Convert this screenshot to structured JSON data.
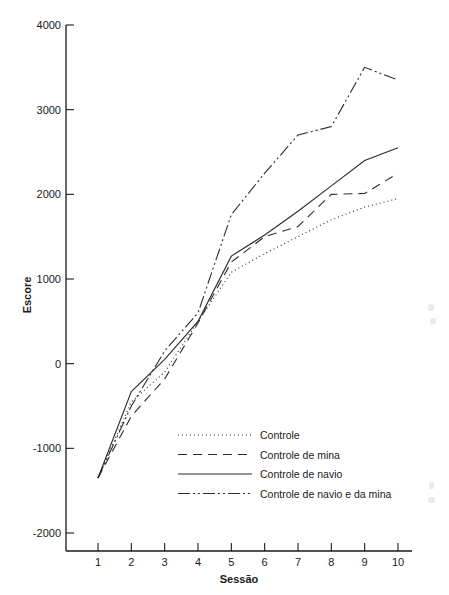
{
  "chart_data": {
    "type": "line",
    "title": "",
    "xlabel": "Sessão",
    "ylabel": "Escore",
    "x": [
      1,
      2,
      3,
      4,
      5,
      6,
      7,
      8,
      9,
      10
    ],
    "categories": [
      "1",
      "2",
      "3",
      "4",
      "5",
      "6",
      "7",
      "8",
      "9",
      "10"
    ],
    "xlim": [
      0.6,
      10.4
    ],
    "ylim": [
      -2200,
      4000
    ],
    "yticks": [
      -2000,
      -1000,
      0,
      1000,
      2000,
      3000,
      4000
    ],
    "ytick_labels": [
      "-2000",
      "-1000",
      "0",
      "1000",
      "2000",
      "3000",
      "4000"
    ],
    "xticks": [
      1,
      2,
      3,
      4,
      5,
      6,
      7,
      8,
      9,
      10
    ],
    "xtick_labels": [
      "1",
      "2",
      "3",
      "4",
      "5",
      "6",
      "7",
      "8",
      "9",
      "10"
    ],
    "grid": false,
    "legend_position": "center",
    "series": [
      {
        "name": "Controle",
        "style": "dotted",
        "dasharray": "1,3",
        "color": "#2b2b2b",
        "values": [
          -1350,
          -450,
          -100,
          500,
          1080,
          1300,
          1500,
          1700,
          1850,
          1950
        ]
      },
      {
        "name": "Controle de mina",
        "style": "dashed",
        "dasharray": "9,6",
        "color": "#2b2b2b",
        "values": [
          -1350,
          -620,
          -180,
          480,
          1200,
          1500,
          1620,
          2000,
          2010,
          2250
        ]
      },
      {
        "name": "Controle de navio",
        "style": "solid",
        "dasharray": "none",
        "color": "#2b2b2b",
        "values": [
          -1350,
          -330,
          50,
          500,
          1270,
          1520,
          1800,
          2100,
          2400,
          2550
        ]
      },
      {
        "name": "Controle de navio e da mina",
        "style": "dash-dot-dot",
        "dasharray": "12,3,2,3,2,3",
        "color": "#2b2b2b",
        "values": [
          -1350,
          -500,
          150,
          600,
          1760,
          2250,
          2700,
          2800,
          3500,
          3350
        ]
      }
    ]
  },
  "legend": {
    "items": [
      {
        "label": "Controle"
      },
      {
        "label": "Controle de mina"
      },
      {
        "label": "Controle de navio"
      },
      {
        "label": "Controle de navio e da mina"
      }
    ]
  },
  "axes": {
    "y_title": "Escore",
    "x_title": "Sessão"
  }
}
